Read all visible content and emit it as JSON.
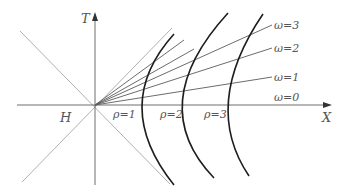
{
  "diagram": {
    "type": "Rindler coordinates / spacetime diagram",
    "axes": {
      "vertical_label": "T",
      "horizontal_label": "X"
    },
    "region_label": "H",
    "hyperbola_labels": [
      "ρ=1",
      "ρ=2",
      "ρ=3"
    ],
    "ray_labels": [
      "ω=3",
      "ω=2",
      "ω=1",
      "ω=0"
    ],
    "colors": {
      "axis": "#6e6e6e",
      "light_lines": "#a8a8a8",
      "hyperbola": "#1e1e1e",
      "rays": "#5a5a5a",
      "text": "#555555"
    }
  }
}
